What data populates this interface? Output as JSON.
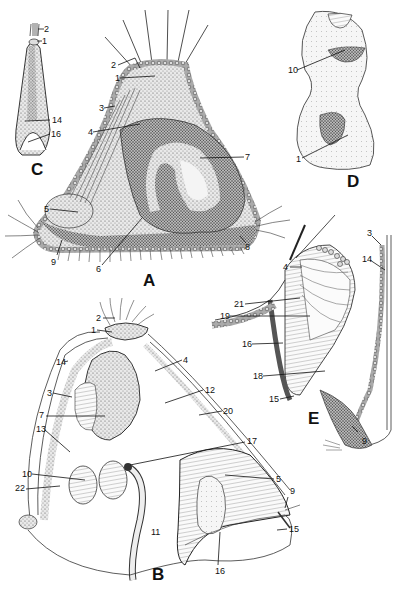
{
  "figure": {
    "panels": [
      "A",
      "B",
      "C",
      "D",
      "E"
    ],
    "panel_labels": {
      "A": {
        "text": "A",
        "x": 143,
        "y": 272
      },
      "B": {
        "text": "B",
        "x": 152,
        "y": 568
      },
      "C": {
        "text": "C",
        "x": 31,
        "y": 163
      },
      "D": {
        "text": "D",
        "x": 347,
        "y": 175
      },
      "E": {
        "text": "E",
        "x": 308,
        "y": 412
      }
    },
    "labels": {
      "C": [
        {
          "text": "2",
          "x": 44,
          "y": 25
        },
        {
          "text": "1",
          "x": 42,
          "y": 38
        },
        {
          "text": "14",
          "x": 52,
          "y": 117
        },
        {
          "text": "16",
          "x": 51,
          "y": 131
        }
      ],
      "A": [
        {
          "text": "2",
          "x": 111,
          "y": 61
        },
        {
          "text": "1",
          "x": 115,
          "y": 74
        },
        {
          "text": "3",
          "x": 99,
          "y": 104
        },
        {
          "text": "4",
          "x": 88,
          "y": 128
        },
        {
          "text": "7",
          "x": 245,
          "y": 155
        },
        {
          "text": "5",
          "x": 44,
          "y": 205
        },
        {
          "text": "6",
          "x": 96,
          "y": 266
        },
        {
          "text": "9",
          "x": 51,
          "y": 260
        },
        {
          "text": "8",
          "x": 244,
          "y": 245
        }
      ],
      "D": [
        {
          "text": "10",
          "x": 290,
          "y": 66
        },
        {
          "text": "1",
          "x": 296,
          "y": 155
        }
      ],
      "E": [
        {
          "text": "3",
          "x": 368,
          "y": 231
        },
        {
          "text": "14",
          "x": 364,
          "y": 256
        },
        {
          "text": "4",
          "x": 284,
          "y": 264
        },
        {
          "text": "21",
          "x": 236,
          "y": 301
        },
        {
          "text": "19",
          "x": 222,
          "y": 313
        },
        {
          "text": "16",
          "x": 244,
          "y": 342
        },
        {
          "text": "18",
          "x": 255,
          "y": 374
        },
        {
          "text": "15",
          "x": 271,
          "y": 396
        },
        {
          "text": "9",
          "x": 362,
          "y": 436
        }
      ],
      "B": [
        {
          "text": "2",
          "x": 96,
          "y": 314
        },
        {
          "text": "1",
          "x": 91,
          "y": 327
        },
        {
          "text": "14",
          "x": 57,
          "y": 359
        },
        {
          "text": "4",
          "x": 183,
          "y": 356
        },
        {
          "text": "3",
          "x": 47,
          "y": 390
        },
        {
          "text": "12",
          "x": 205,
          "y": 386
        },
        {
          "text": "7",
          "x": 39,
          "y": 412
        },
        {
          "text": "20",
          "x": 223,
          "y": 407
        },
        {
          "text": "13",
          "x": 37,
          "y": 426
        },
        {
          "text": "17",
          "x": 247,
          "y": 438
        },
        {
          "text": "10",
          "x": 23,
          "y": 471
        },
        {
          "text": "5",
          "x": 276,
          "y": 475
        },
        {
          "text": "22",
          "x": 16,
          "y": 485
        },
        {
          "text": "9",
          "x": 290,
          "y": 489
        },
        {
          "text": "11",
          "x": 151,
          "y": 528
        },
        {
          "text": "15",
          "x": 289,
          "y": 525
        },
        {
          "text": "16",
          "x": 215,
          "y": 568
        }
      ]
    }
  }
}
